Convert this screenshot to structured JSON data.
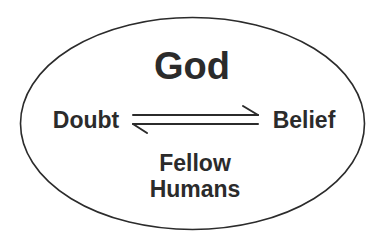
{
  "diagram": {
    "title": "God",
    "left_node": "Doubt",
    "right_node": "Belief",
    "bottom_line1": "Fellow",
    "bottom_line2": "Humans",
    "arrows": [
      {
        "from": "Doubt",
        "to": "Belief",
        "direction": "right"
      },
      {
        "from": "Belief",
        "to": "Doubt",
        "direction": "left"
      }
    ],
    "container_shape": "ellipse",
    "colors": {
      "stroke": "#2b2b2b",
      "text": "#2b2b2b",
      "background": "#ffffff"
    }
  }
}
